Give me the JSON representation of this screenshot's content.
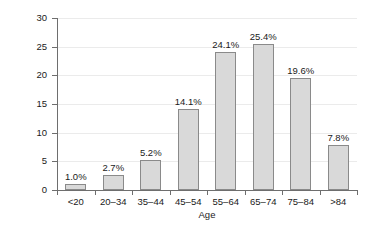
{
  "chart_data": {
    "type": "bar",
    "title": "",
    "xlabel": "Age",
    "ylabel": "Percent of New Cases",
    "categories": [
      "<20",
      "20–34",
      "35–44",
      "45–54",
      "55–64",
      "65–74",
      "75–84",
      ">84"
    ],
    "values": [
      1.0,
      2.7,
      5.2,
      14.1,
      24.1,
      25.4,
      19.6,
      7.8
    ],
    "data_labels": [
      "1.0%",
      "2.7%",
      "5.2%",
      "14.1%",
      "24.1%",
      "25.4%",
      "19.6%",
      "7.8%"
    ],
    "ylim": [
      0,
      30
    ],
    "yticks": [
      0,
      5,
      10,
      15,
      20,
      25,
      30
    ],
    "ytick_labels": [
      "0",
      "5",
      "10",
      "15",
      "20",
      "25",
      "30"
    ],
    "grid": true,
    "legend": null,
    "colors": {
      "bar_fill": "#d9d9d9",
      "bar_border": "#8a8a8a",
      "axis": "#6e6e6e",
      "gridline": "#ebebeb",
      "text": "#1a1a1a",
      "background": "#ffffff"
    }
  }
}
